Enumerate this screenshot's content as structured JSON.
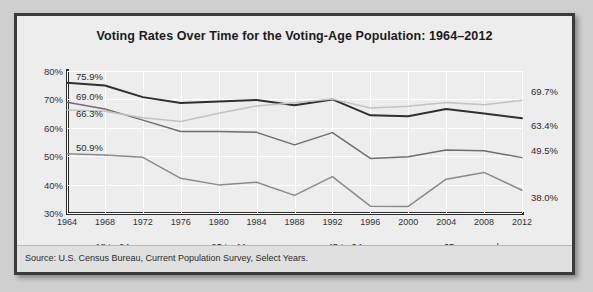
{
  "chart_data": {
    "type": "line",
    "title": "Voting Rates Over Time for the Voting-Age Population: 1964–2012",
    "xlabel": "",
    "ylabel": "",
    "ylim": [
      30,
      80
    ],
    "ytick_step": 10,
    "grid": true,
    "legend_position": "bottom",
    "categories": [
      1964,
      1968,
      1972,
      1976,
      1980,
      1984,
      1988,
      1992,
      1996,
      2000,
      2004,
      2008,
      2012
    ],
    "series": [
      {
        "name": "18 to 24 years",
        "color": "#8a8a8a",
        "values": [
          50.9,
          50.4,
          49.6,
          42.2,
          39.9,
          40.8,
          36.2,
          42.8,
          32.4,
          32.3,
          41.9,
          44.3,
          38.0
        ],
        "start_label": "50.9%",
        "end_label": "38.0%"
      },
      {
        "name": "25 to 44 years",
        "color": "#6e6e6e",
        "values": [
          69.0,
          66.6,
          62.7,
          58.7,
          58.7,
          58.4,
          54.0,
          58.3,
          49.2,
          49.8,
          52.2,
          51.9,
          49.5
        ],
        "start_label": "69.0%",
        "end_label": "49.5%"
      },
      {
        "name": "45 to 64 years",
        "color": "#2f2f2f",
        "values": [
          75.9,
          74.9,
          70.8,
          68.7,
          69.3,
          69.8,
          67.9,
          70.0,
          64.4,
          64.1,
          66.6,
          65.0,
          63.4
        ],
        "start_label": "75.9%",
        "end_label": "63.4%"
      },
      {
        "name": "65 years and over",
        "color": "#c2c2c2",
        "values": [
          66.3,
          65.8,
          63.5,
          62.2,
          65.1,
          67.7,
          68.8,
          70.1,
          67.0,
          67.6,
          68.9,
          68.1,
          69.7
        ],
        "start_label": "66.3%",
        "end_label": "69.7%"
      }
    ],
    "ytick_labels": [
      "80%",
      "70%",
      "60%",
      "50%",
      "40%",
      "30%"
    ],
    "xtick_labels": [
      "1964",
      "1968",
      "1972",
      "1976",
      "1980",
      "1984",
      "1988",
      "1992",
      "1996",
      "2000",
      "2004",
      "2008",
      "2012"
    ]
  },
  "source": {
    "text": "Source: U.S. Census Bureau, Current Population Survey, Select Years."
  }
}
